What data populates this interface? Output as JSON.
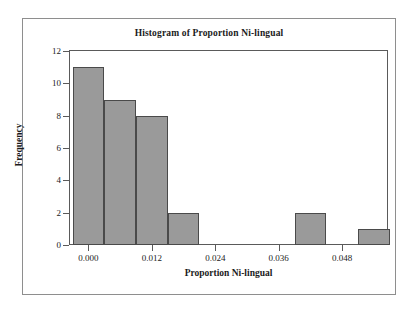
{
  "figure": {
    "kind": "statistics-histogram-figure",
    "background_color": "#ffffff",
    "border_color": "#8e8e8e"
  },
  "chart_data": {
    "type": "bar",
    "title": "Histogram of Proportion Ni-lingual",
    "xlabel": "Proportion Ni-lingual",
    "ylabel": "Frequency",
    "grid": false,
    "legend": false,
    "bar_fill_color": "#9a9a9a",
    "bar_edge_color": "#4a4a4a",
    "axis_color": "#5a5a5a",
    "xlim": [
      -0.0035,
      0.0565
    ],
    "ylim": [
      0,
      12
    ],
    "bin_width": 0.006,
    "xticks": [
      0.0,
      0.012,
      0.024,
      0.036,
      0.048
    ],
    "xtick_labels": [
      "0.000",
      "0.012",
      "0.024",
      "0.036",
      "0.048"
    ],
    "yticks": [
      0,
      2,
      4,
      6,
      8,
      10,
      12
    ],
    "ytick_labels": [
      "0",
      "2",
      "4",
      "6",
      "8",
      "10",
      "12"
    ],
    "bins": [
      {
        "left": -0.003,
        "right": 0.003,
        "center": 0.0,
        "frequency": 11
      },
      {
        "left": 0.003,
        "right": 0.009,
        "center": 0.006,
        "frequency": 9
      },
      {
        "left": 0.009,
        "right": 0.015,
        "center": 0.012,
        "frequency": 8
      },
      {
        "left": 0.015,
        "right": 0.021,
        "center": 0.018,
        "frequency": 2
      },
      {
        "left": 0.021,
        "right": 0.027,
        "center": 0.024,
        "frequency": 0
      },
      {
        "left": 0.027,
        "right": 0.033,
        "center": 0.03,
        "frequency": 0
      },
      {
        "left": 0.033,
        "right": 0.039,
        "center": 0.036,
        "frequency": 0
      },
      {
        "left": 0.039,
        "right": 0.045,
        "center": 0.042,
        "frequency": 2
      },
      {
        "left": 0.045,
        "right": 0.051,
        "center": 0.048,
        "frequency": 0
      },
      {
        "left": 0.051,
        "right": 0.057,
        "center": 0.054,
        "frequency": 1
      }
    ],
    "categories": [
      "0.000",
      "0.006",
      "0.012",
      "0.018",
      "0.024",
      "0.030",
      "0.036",
      "0.042",
      "0.048",
      "0.054"
    ],
    "values": [
      11,
      9,
      8,
      2,
      0,
      0,
      0,
      2,
      0,
      1
    ]
  }
}
